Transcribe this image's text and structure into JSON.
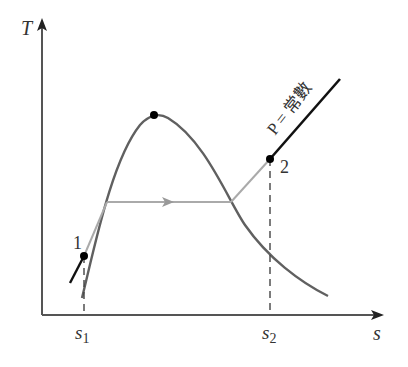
{
  "diagram": {
    "axes": {
      "y_label": "T",
      "x_label": "s",
      "x_ticks": [
        {
          "main": "s",
          "sub": "1"
        },
        {
          "main": "s",
          "sub": "2"
        }
      ]
    },
    "points": [
      {
        "label": "1"
      },
      {
        "label": "2"
      }
    ],
    "curves": {
      "isobar_label": "P = 常數",
      "saturation_dome": "saturation dome with critical point"
    },
    "colors": {
      "axis": "#555555",
      "dome": "#606060",
      "isobar_dark": "#111111",
      "isobar_light": "#aaaaaa",
      "point": "#000000"
    }
  }
}
